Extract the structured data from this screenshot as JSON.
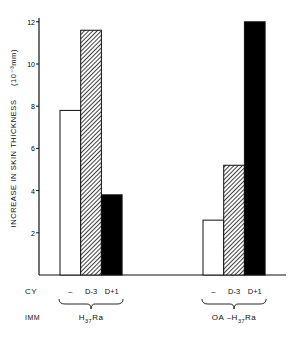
{
  "chart_data": {
    "type": "bar",
    "title": "",
    "xlabel": "",
    "ylabel": "INCREASE IN SKIN THICKNESS (10⁻³mm)",
    "ylim": [
      0,
      12
    ],
    "yticks": [
      2,
      4,
      6,
      8,
      10,
      12
    ],
    "grid": false,
    "legend": "none",
    "row_labels": {
      "cy": "CY",
      "imm": "IMM"
    },
    "categories": [
      "H37Ra",
      "OA–H37Ra"
    ],
    "series": [
      {
        "name": "–",
        "pattern": "open",
        "values": [
          7.8,
          2.6
        ]
      },
      {
        "name": "D-3",
        "pattern": "hatched",
        "values": [
          11.6,
          5.2
        ]
      },
      {
        "name": "D+1",
        "pattern": "solid-black",
        "values": [
          3.8,
          12.0
        ]
      }
    ],
    "groups": [
      {
        "cy_labels": [
          "–",
          "D-3",
          "D+1"
        ],
        "imm_label_main": "H",
        "imm_label_sub": "37",
        "imm_label_tail": "Ra"
      },
      {
        "cy_labels": [
          "–",
          "D-3",
          "D+1"
        ],
        "imm_label_main": "OA –H",
        "imm_label_sub": "37",
        "imm_label_tail": "Ra"
      }
    ]
  },
  "axis": {
    "y_label_main": "INCREASE IN SKIN THICKNESS",
    "y_label_unit": "(10⁻³mm)",
    "tick_labels": [
      "2",
      "4",
      "6",
      "8",
      "10",
      "12"
    ]
  },
  "rows": {
    "cy": "CY",
    "imm": "IMM"
  },
  "caption_fragment": ""
}
